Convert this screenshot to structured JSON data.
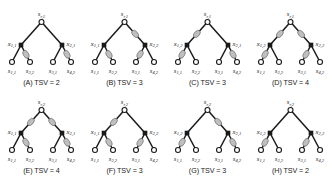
{
  "figure": {
    "colors": {
      "edge": "#1a1a1a",
      "filled_node": "#1a1a1a",
      "open_node_fill": "#ffffff",
      "tsv_node_fill": "#bfbfbf",
      "tsv_node_stroke": "#6e6e6e",
      "text": "#1a1a1a",
      "background": "#ffffff"
    },
    "legend_notes": {
      "open_circle": "unfilled circle node",
      "filled_square": "filled square node",
      "gray_ellipse": "TSV marker on edge"
    }
  },
  "panels": [
    {
      "id": "A",
      "caption": "(A) TSV = 2",
      "tsv": 2,
      "root": {
        "base": "s",
        "sub": "r,1"
      },
      "left_node": {
        "base": "x",
        "sub": "1,1"
      },
      "right_node": {
        "base": "x",
        "sub": "2,1"
      },
      "leaves": [
        {
          "base": "s",
          "sub": "1,1"
        },
        {
          "base": "s",
          "sub": "2,2"
        },
        {
          "base": "s",
          "sub": "3,1"
        },
        {
          "base": "s",
          "sub": "4,2"
        }
      ],
      "tsv_edges": [
        "leaf2",
        "leaf4"
      ]
    },
    {
      "id": "B",
      "caption": "(B) TSV = 3",
      "tsv": 3,
      "root": {
        "base": "s",
        "sub": "r,1"
      },
      "left_node": {
        "base": "x",
        "sub": "1,1"
      },
      "right_node": {
        "base": "x",
        "sub": "2,2"
      },
      "leaves": [
        {
          "base": "s",
          "sub": "1,1"
        },
        {
          "base": "s",
          "sub": "2,2"
        },
        {
          "base": "s",
          "sub": "3,1"
        },
        {
          "base": "s",
          "sub": "4,2"
        }
      ],
      "tsv_edges": [
        "root-right",
        "leaf2",
        "leaf3"
      ]
    },
    {
      "id": "C",
      "caption": "(C) TSV = 3",
      "tsv": 3,
      "root": {
        "base": "s",
        "sub": "r,1"
      },
      "left_node": {
        "base": "x",
        "sub": "1,2"
      },
      "right_node": {
        "base": "x",
        "sub": "2,1"
      },
      "leaves": [
        {
          "base": "s",
          "sub": "1,1"
        },
        {
          "base": "s",
          "sub": "2,2"
        },
        {
          "base": "s",
          "sub": "3,1"
        },
        {
          "base": "s",
          "sub": "4,2"
        }
      ],
      "tsv_edges": [
        "root-left",
        "leaf1",
        "leaf4"
      ]
    },
    {
      "id": "D",
      "caption": "(D) TSV = 4",
      "tsv": 4,
      "root": {
        "base": "s",
        "sub": "r,1"
      },
      "left_node": {
        "base": "x",
        "sub": "1,2"
      },
      "right_node": {
        "base": "x",
        "sub": "2,2"
      },
      "leaves": [
        {
          "base": "s",
          "sub": "1,1"
        },
        {
          "base": "s",
          "sub": "2,2"
        },
        {
          "base": "s",
          "sub": "3,1"
        },
        {
          "base": "s",
          "sub": "4,2"
        }
      ],
      "tsv_edges": [
        "root-left",
        "root-right",
        "leaf1",
        "leaf3"
      ]
    },
    {
      "id": "E",
      "caption": "(E) TSV = 4",
      "tsv": 4,
      "root": {
        "base": "s",
        "sub": "r,2"
      },
      "left_node": {
        "base": "x",
        "sub": "1,1"
      },
      "right_node": {
        "base": "x",
        "sub": "2,1"
      },
      "leaves": [
        {
          "base": "s",
          "sub": "1,1"
        },
        {
          "base": "s",
          "sub": "2,2"
        },
        {
          "base": "s",
          "sub": "3,1"
        },
        {
          "base": "s",
          "sub": "4,2"
        }
      ],
      "tsv_edges": [
        "root-left",
        "root-right",
        "leaf2",
        "leaf4"
      ]
    },
    {
      "id": "F",
      "caption": "(F) TSV = 3",
      "tsv": 3,
      "root": {
        "base": "s",
        "sub": "r,2"
      },
      "left_node": {
        "base": "x",
        "sub": "1,1"
      },
      "right_node": {
        "base": "x",
        "sub": "2,2"
      },
      "leaves": [
        {
          "base": "s",
          "sub": "1,1"
        },
        {
          "base": "s",
          "sub": "2,2"
        },
        {
          "base": "s",
          "sub": "3,1"
        },
        {
          "base": "s",
          "sub": "4,2"
        }
      ],
      "tsv_edges": [
        "root-left",
        "leaf2",
        "leaf3"
      ]
    },
    {
      "id": "G",
      "caption": "(G) TSV = 3",
      "tsv": 3,
      "root": {
        "base": "s",
        "sub": "r,2"
      },
      "left_node": {
        "base": "x",
        "sub": "1,2"
      },
      "right_node": {
        "base": "x",
        "sub": "2,1"
      },
      "leaves": [
        {
          "base": "s",
          "sub": "1,1"
        },
        {
          "base": "s",
          "sub": "2,2"
        },
        {
          "base": "s",
          "sub": "3,1"
        },
        {
          "base": "s",
          "sub": "4,2"
        }
      ],
      "tsv_edges": [
        "root-right",
        "leaf1",
        "leaf4"
      ]
    },
    {
      "id": "H",
      "caption": "(H) TSV = 2",
      "tsv": 2,
      "root": {
        "base": "s",
        "sub": "r,2"
      },
      "left_node": {
        "base": "x",
        "sub": "1,2"
      },
      "right_node": {
        "base": "x",
        "sub": "2,2"
      },
      "leaves": [
        {
          "base": "s",
          "sub": "1,1"
        },
        {
          "base": "s",
          "sub": "2,2"
        },
        {
          "base": "s",
          "sub": "3,1"
        },
        {
          "base": "s",
          "sub": "4,2"
        }
      ],
      "tsv_edges": [
        "leaf1",
        "leaf3"
      ]
    }
  ]
}
